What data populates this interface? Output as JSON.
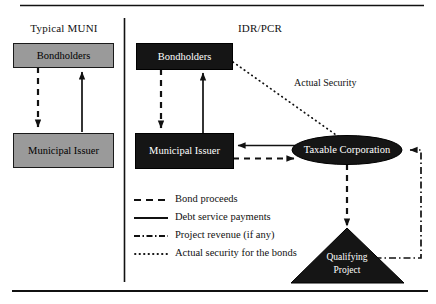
{
  "figure": {
    "panels": [
      {
        "id": "typical-muni",
        "title": "Typical MUNI"
      },
      {
        "id": "idr-pcr",
        "title": "IDR/PCR"
      }
    ],
    "nodes": {
      "muni_bondholders": "Bondholders",
      "muni_issuer": "Municipal Issuer",
      "idr_bondholders": "Bondholders",
      "idr_issuer": "Municipal Issuer",
      "taxable_corporation": "Taxable Corporation",
      "qualifying_project_line1": "Qualifying",
      "qualifying_project_line2": "Project"
    },
    "edge_labels": {
      "actual_security": "Actual Security"
    },
    "legend": [
      {
        "style": "dashed",
        "label": "Bond proceeds"
      },
      {
        "style": "solid",
        "label": "Debt service payments"
      },
      {
        "style": "dashdot",
        "label": "Project revenue (if any)"
      },
      {
        "style": "dotted",
        "label": "Actual security for the bonds"
      }
    ],
    "colors": {
      "muni_box_fill": "#9a9a9a",
      "idr_box_fill": "#151515",
      "stroke": "#111111",
      "background": "#ffffff",
      "label_light": "#ffffff"
    }
  }
}
